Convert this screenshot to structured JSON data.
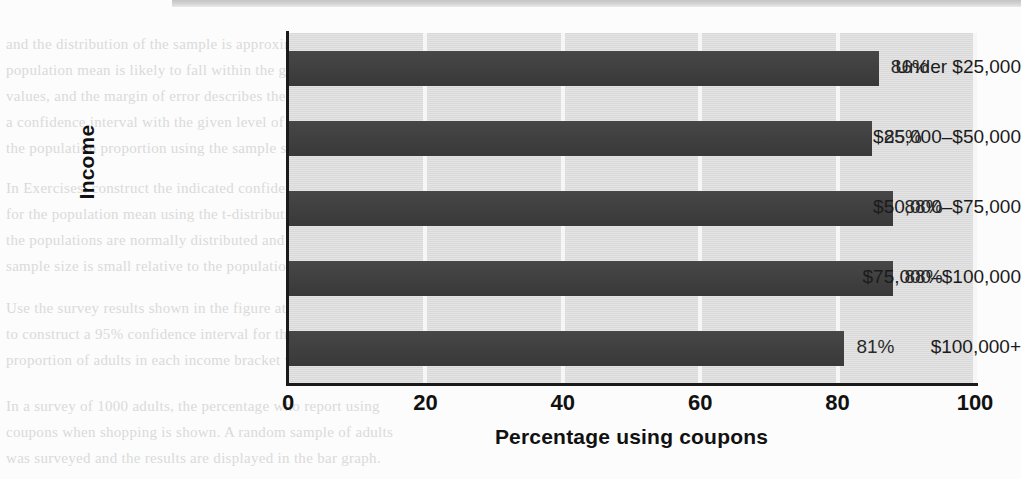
{
  "chart_data": {
    "type": "bar",
    "orientation": "horizontal",
    "title": "",
    "xlabel": "Percentage using coupons",
    "ylabel": "Income",
    "categories": [
      "Under $25,000",
      "$25,000–$50,000",
      "$50,000–$75,000",
      "$75,000–$100,000",
      "$100,000+"
    ],
    "values": [
      86,
      85,
      88,
      88,
      81
    ],
    "value_labels": [
      "86%",
      "85%",
      "88%",
      "88%",
      "81%"
    ],
    "xlim": [
      0,
      100
    ],
    "xticks": [
      0,
      20,
      40,
      60,
      80,
      100
    ],
    "xtick_labels": [
      "0",
      "20",
      "40",
      "60",
      "80",
      "100"
    ],
    "grid": "vertical",
    "legend": "none",
    "colors": {
      "bar": "#3d3d3d",
      "plot_background": "#dddddd",
      "gridline": "#f6f6f6",
      "axis": "#1a1a1a",
      "text": "#111111",
      "page_background": "#fcfcfc"
    }
  },
  "background_bleed": [
    {
      "text": "and the distribution of the sample is approximately normal, the",
      "x": 6,
      "y": 36
    },
    {
      "text": "population mean is likely to fall within the given interval of",
      "x": 6,
      "y": 62
    },
    {
      "text": "values, and the margin of error describes the range.",
      "x": 6,
      "y": 88
    },
    {
      "text": "a confidence interval with the given level of confidence for",
      "x": 6,
      "y": 114
    },
    {
      "text": "the population proportion using the sample statistic below.",
      "x": 6,
      "y": 140
    },
    {
      "text": "In Exercises, construct the indicated confidence interval",
      "x": 6,
      "y": 180
    },
    {
      "text": "for the population mean using the t-distribution. Assume",
      "x": 6,
      "y": 206
    },
    {
      "text": "the populations are normally distributed and note the",
      "x": 6,
      "y": 232
    },
    {
      "text": "sample size is small relative to the population size.",
      "x": 6,
      "y": 258
    },
    {
      "text": "Use the survey results shown in the figure at the right",
      "x": 6,
      "y": 300
    },
    {
      "text": "to construct a 95% confidence interval for the population",
      "x": 6,
      "y": 326
    },
    {
      "text": "proportion of adults in each income bracket who use coupons.",
      "x": 6,
      "y": 352
    },
    {
      "text": "In a survey of 1000 adults, the percentage who report using",
      "x": 6,
      "y": 398
    },
    {
      "text": "coupons when shopping is shown. A random sample of adults",
      "x": 6,
      "y": 424
    },
    {
      "text": "was surveyed and the results are displayed in the bar graph.",
      "x": 6,
      "y": 450
    }
  ]
}
